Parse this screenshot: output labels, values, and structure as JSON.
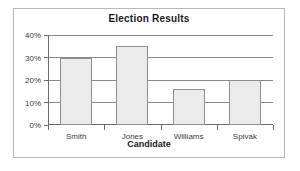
{
  "chart_data": {
    "type": "bar",
    "title": "Election Results",
    "xlabel": "Candidate",
    "ylabel": "",
    "categories": [
      "Smith",
      "Jones",
      "Williams",
      "Spivak"
    ],
    "values": [
      30,
      35,
      16,
      20
    ],
    "ytick_labels": [
      "0%",
      "10%",
      "20%",
      "30%",
      "40%"
    ],
    "ytick_values": [
      0,
      10,
      20,
      30,
      40
    ],
    "ylim": [
      0,
      40
    ],
    "grid": true,
    "legend": false,
    "value_suffix": "%",
    "series": [
      {
        "name": "Percent of vote",
        "values": [
          30,
          35,
          16,
          20
        ]
      }
    ]
  },
  "style": {
    "bar_fill": "#ebebeb",
    "bar_border": "#8f8f8f",
    "axis_color": "#6b6b6b",
    "grid_color": "#8a8a8a",
    "frame_border": "#b8b8b8",
    "background": "#ffffff",
    "text_color": "#1a1a1a"
  }
}
